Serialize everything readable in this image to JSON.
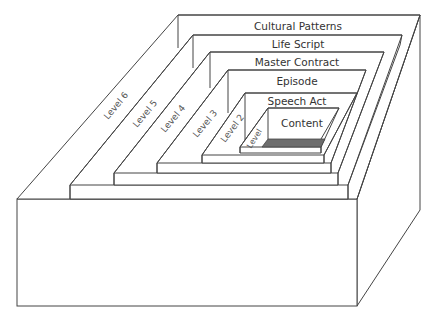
{
  "diagram": {
    "type": "nested-box-hierarchy",
    "rings": [
      {
        "level": 6,
        "level_label": "Level 6",
        "title": "Cultural Patterns"
      },
      {
        "level": 5,
        "level_label": "Level 5",
        "title": "Life Script"
      },
      {
        "level": 4,
        "level_label": "Level 4",
        "title": "Master Contract"
      },
      {
        "level": 3,
        "level_label": "Level 3",
        "title": "Episode"
      },
      {
        "level": 2,
        "level_label": "Level 2",
        "title": "Speech Act"
      },
      {
        "level": 1,
        "level_label": "Level",
        "title": "Content"
      }
    ],
    "colors": {
      "stroke": "#444444",
      "background": "#ffffff",
      "content_floor": "#6e6e6e"
    }
  }
}
